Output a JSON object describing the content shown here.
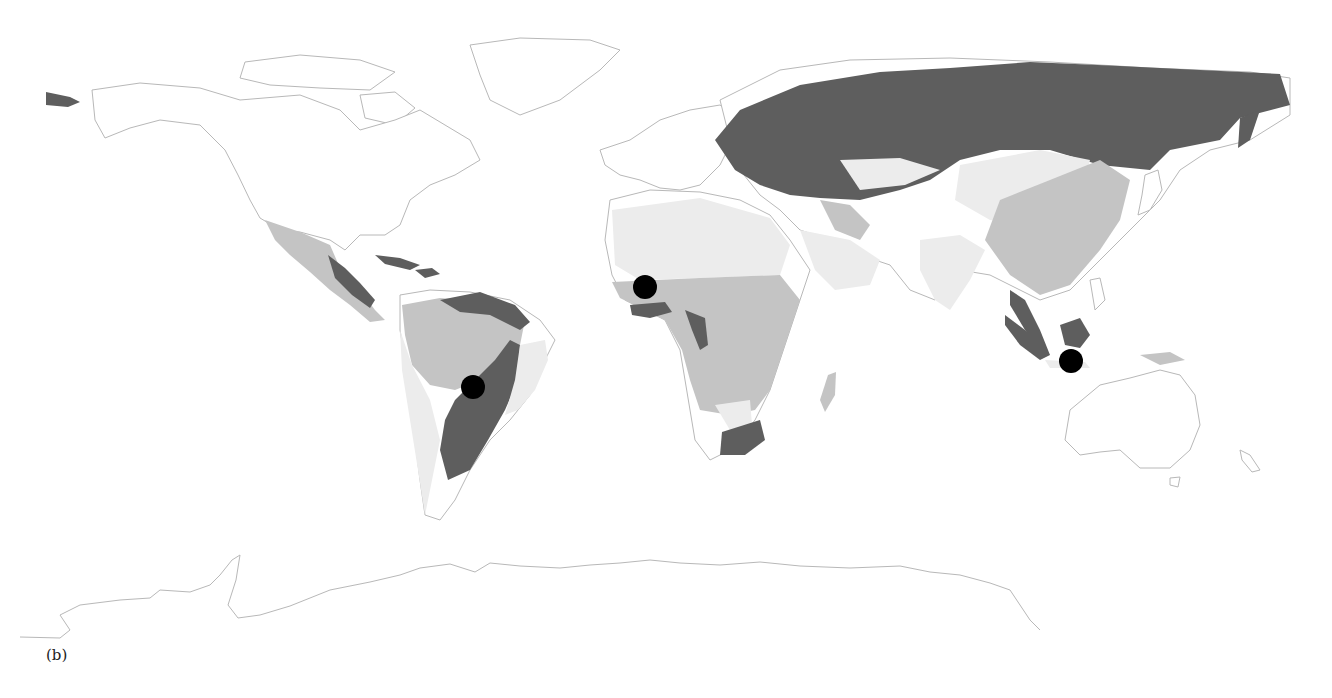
{
  "figure": {
    "caption": "(b)",
    "type": "world-map",
    "projection": "equirectangular",
    "colors": {
      "background": "#ffffff",
      "coastline": "#b8b8b8",
      "dark_region": "#5e5e5e",
      "mid_region": "#c4c4c4",
      "light_region": "#ececec",
      "marker": "#000000"
    }
  },
  "regions": [
    {
      "name": "northern-eurasia-boreal",
      "shade": "dark"
    },
    {
      "name": "south-america-east",
      "shade": "dark"
    },
    {
      "name": "southern-africa",
      "shade": "dark"
    },
    {
      "name": "indonesia-borneo",
      "shade": "dark"
    },
    {
      "name": "amazon-basin",
      "shade": "mid"
    },
    {
      "name": "central-africa",
      "shade": "mid"
    },
    {
      "name": "mexico",
      "shade": "mid"
    },
    {
      "name": "east-asia",
      "shade": "mid"
    },
    {
      "name": "sahara-arabia",
      "shade": "light"
    },
    {
      "name": "central-asia",
      "shade": "light"
    }
  ],
  "markers": [
    {
      "label": "South America",
      "x": 473,
      "y": 387
    },
    {
      "label": "West Africa",
      "x": 645,
      "y": 287
    },
    {
      "label": "Java",
      "x": 1071,
      "y": 361
    }
  ]
}
